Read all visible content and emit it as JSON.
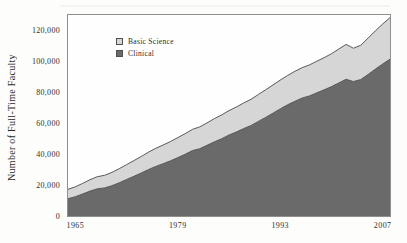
{
  "figure": {
    "y_axis_title": "Number of Full-Time Faculty",
    "legend": [
      {
        "label": "Basic Science",
        "color": "#d6d6d6",
        "border": "#4f4f4f"
      },
      {
        "label": "Clinical",
        "color": "#6a6a6a",
        "border": "#4f4f4f"
      }
    ]
  },
  "chart_data": {
    "type": "area",
    "stacked": true,
    "title": "",
    "xlabel": "",
    "ylabel": "Number of Full-Time Faculty",
    "grid": false,
    "legend_position": "upper-left-inside",
    "xlim": [
      1964,
      2008
    ],
    "ylim": [
      0,
      130000
    ],
    "x": [
      1964,
      1965,
      1966,
      1967,
      1968,
      1969,
      1970,
      1971,
      1972,
      1973,
      1974,
      1975,
      1976,
      1977,
      1978,
      1979,
      1980,
      1981,
      1982,
      1983,
      1984,
      1985,
      1986,
      1987,
      1988,
      1989,
      1990,
      1991,
      1992,
      1993,
      1994,
      1995,
      1996,
      1997,
      1998,
      1999,
      2000,
      2001,
      2002,
      2003,
      2004,
      2005,
      2006,
      2007,
      2008
    ],
    "series": [
      {
        "name": "Clinical",
        "color": "#6a6a6a",
        "edge": "#4a4a4a",
        "values": [
          11200,
          12500,
          14200,
          16100,
          17600,
          18200,
          19600,
          21500,
          23600,
          25700,
          27800,
          30100,
          32100,
          33800,
          35700,
          37800,
          39900,
          42300,
          43500,
          45700,
          48000,
          50000,
          52400,
          54300,
          56500,
          58500,
          61200,
          63800,
          66500,
          69300,
          71900,
          74200,
          76300,
          77700,
          79700,
          81600,
          83700,
          86100,
          88400,
          87000,
          88200,
          91500,
          95000,
          98300,
          101500
        ]
      },
      {
        "name": "Basic Science",
        "color": "#d6d6d6",
        "edge": "#4a4a4a",
        "values": [
          6100,
          6400,
          6900,
          7400,
          7800,
          8100,
          8600,
          9100,
          9600,
          10100,
          10700,
          11200,
          11700,
          12100,
          12500,
          12900,
          13300,
          13700,
          14100,
          14500,
          15000,
          15400,
          15800,
          16200,
          16600,
          17000,
          17400,
          17800,
          18200,
          18600,
          19000,
          19400,
          19700,
          20000,
          20400,
          20800,
          21300,
          21900,
          22600,
          21500,
          22200,
          23500,
          24800,
          25900,
          26800
        ]
      }
    ],
    "yticks": [
      {
        "v": 0,
        "label": "0"
      },
      {
        "v": 20000,
        "label": "20,000"
      },
      {
        "v": 40000,
        "label": "40,000"
      },
      {
        "v": 60000,
        "label": "60,000"
      },
      {
        "v": 80000,
        "label": "80,000"
      },
      {
        "v": 100000,
        "label": "100,000"
      },
      {
        "v": 120000,
        "label": "120,000"
      }
    ],
    "xticks": [
      {
        "v": 1965,
        "label": "1965"
      },
      {
        "v": 1979,
        "label": "1979"
      },
      {
        "v": 1993,
        "label": "1993"
      },
      {
        "v": 2007,
        "label": "2007"
      }
    ]
  }
}
